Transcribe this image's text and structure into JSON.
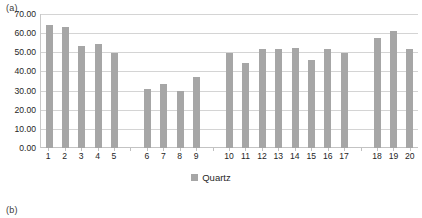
{
  "panels": {
    "a_label": "(a)",
    "b_label": "(b)"
  },
  "legend": {
    "label": "Quartz",
    "swatch_color": "#a6a6a6",
    "position": "bottom-center"
  },
  "colors": {
    "bar": "#a6a6a6",
    "gridline": "#d4d4d4",
    "axis": "#c9c9c9",
    "text": "#262626"
  },
  "chart_data": {
    "type": "bar",
    "title": "",
    "subtitle": "",
    "xlabel": "",
    "ylabel": "",
    "ylim": [
      0,
      70
    ],
    "ytick_step": 10,
    "ytick_labels": [
      "0.00",
      "10.00",
      "20.00",
      "30.00",
      "40.00",
      "50.00",
      "60.00",
      "70.00"
    ],
    "grid": true,
    "legend_position": "bottom-center",
    "categories": [
      "1",
      "2",
      "3",
      "4",
      "5",
      "6",
      "7",
      "8",
      "9",
      "10",
      "11",
      "12",
      "13",
      "14",
      "15",
      "16",
      "17",
      "18",
      "19",
      "20"
    ],
    "series": [
      {
        "name": "Quartz",
        "values": [
          64.5,
          63.0,
          53.5,
          54.5,
          49.5,
          31.0,
          33.5,
          30.0,
          37.0,
          49.5,
          44.5,
          51.5,
          51.5,
          52.0,
          46.0,
          51.5,
          49.5,
          57.5,
          61.0,
          51.5
        ]
      }
    ],
    "group_breaks_after": [
      "5",
      "9",
      "17"
    ],
    "slots": [
      {
        "label": "1",
        "value": 64.5,
        "empty": false
      },
      {
        "label": "2",
        "value": 63.0,
        "empty": false
      },
      {
        "label": "3",
        "value": 53.5,
        "empty": false
      },
      {
        "label": "4",
        "value": 54.5,
        "empty": false
      },
      {
        "label": "5",
        "value": 49.5,
        "empty": false
      },
      {
        "label": "",
        "value": 0,
        "empty": true
      },
      {
        "label": "6",
        "value": 31.0,
        "empty": false
      },
      {
        "label": "7",
        "value": 33.5,
        "empty": false
      },
      {
        "label": "8",
        "value": 30.0,
        "empty": false
      },
      {
        "label": "9",
        "value": 37.0,
        "empty": false
      },
      {
        "label": "",
        "value": 0,
        "empty": true
      },
      {
        "label": "10",
        "value": 49.5,
        "empty": false
      },
      {
        "label": "11",
        "value": 44.5,
        "empty": false
      },
      {
        "label": "12",
        "value": 51.5,
        "empty": false
      },
      {
        "label": "13",
        "value": 51.5,
        "empty": false
      },
      {
        "label": "14",
        "value": 52.0,
        "empty": false
      },
      {
        "label": "15",
        "value": 46.0,
        "empty": false
      },
      {
        "label": "16",
        "value": 51.5,
        "empty": false
      },
      {
        "label": "17",
        "value": 49.5,
        "empty": false
      },
      {
        "label": "",
        "value": 0,
        "empty": true
      },
      {
        "label": "18",
        "value": 57.5,
        "empty": false
      },
      {
        "label": "19",
        "value": 61.0,
        "empty": false
      },
      {
        "label": "20",
        "value": 51.5,
        "empty": false
      }
    ]
  }
}
